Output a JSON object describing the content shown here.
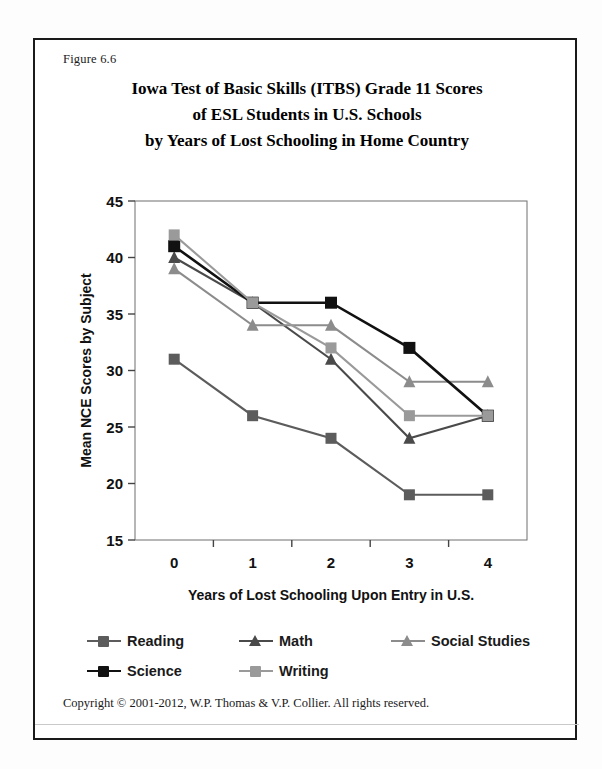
{
  "figure": {
    "number_label": "Figure 6.6",
    "footer": "Copyright © 2001-2012, W.P. Thomas & V.P. Collier.  All rights reserved."
  },
  "chart_data": {
    "type": "line",
    "title": "Iowa Test of Basic Skills (ITBS) Grade 11 Scores of ESL Students in U.S. Schools by Years of Lost Schooling in Home Country",
    "title_lines": [
      "Iowa Test of Basic Skills (ITBS) Grade 11 Scores",
      "of ESL Students in U.S. Schools",
      "by Years of Lost Schooling in Home Country"
    ],
    "xlabel": "Years of Lost Schooling Upon Entry in U.S.",
    "ylabel": "Mean NCE Scores by Subject",
    "categories": [
      "0",
      "1",
      "2",
      "3",
      "4"
    ],
    "ylim": [
      15,
      45
    ],
    "yticks": [
      "15",
      "20",
      "25",
      "30",
      "35",
      "40",
      "45"
    ],
    "ytick_values": [
      15,
      20,
      25,
      30,
      35,
      40,
      45
    ],
    "grid": false,
    "legend_position": "bottom",
    "series": [
      {
        "name": "Reading",
        "values": [
          31,
          26,
          24,
          19,
          19
        ],
        "color": "#5c5c5c",
        "marker": "square"
      },
      {
        "name": "Math",
        "values": [
          40,
          36,
          31,
          24,
          26
        ],
        "color": "#4a4a4a",
        "marker": "triangle"
      },
      {
        "name": "Social Studies",
        "values": [
          39,
          34,
          34,
          29,
          29
        ],
        "color": "#8c8c8c",
        "marker": "triangle"
      },
      {
        "name": "Science",
        "values": [
          41,
          36,
          36,
          32,
          26
        ],
        "color": "#111111",
        "marker": "square"
      },
      {
        "name": "Writing",
        "values": [
          42,
          36,
          32,
          26,
          26
        ],
        "color": "#9a9a9a",
        "marker": "square"
      }
    ]
  }
}
